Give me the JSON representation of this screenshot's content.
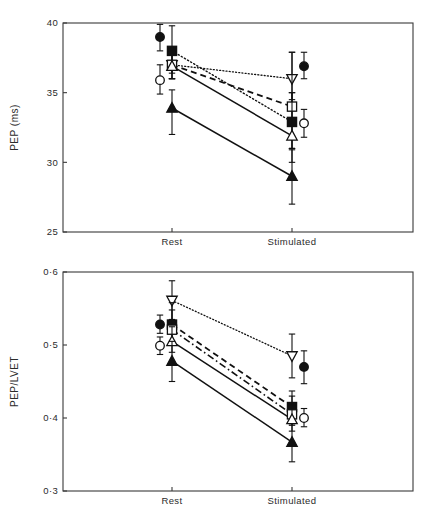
{
  "figure": {
    "panels": [
      "pep",
      "ratio"
    ]
  },
  "chart_data": [
    {
      "id": "pep",
      "type": "line",
      "title": "",
      "xlabel": "",
      "ylabel": "PEP (ms)",
      "categories": [
        "Rest",
        "Stimulated"
      ],
      "x_tick_labels": [
        "Rest",
        "Stimulated"
      ],
      "y_tick_labels": [
        "40",
        "35",
        "30",
        "25"
      ],
      "y_ticks": [
        40,
        35,
        30,
        25
      ],
      "ylim": [
        25,
        40
      ],
      "grid": false,
      "legend": "none",
      "series": [
        {
          "name": "filled-circle",
          "marker": "filled-circle",
          "line": "none",
          "offset": "left",
          "values": [
            39.0,
            36.9
          ],
          "err_low": [
            38.0,
            36.0
          ],
          "err_high": [
            39.9,
            37.9
          ]
        },
        {
          "name": "open-circle",
          "marker": "open-circle",
          "line": "none",
          "offset": "left-right",
          "values": [
            35.9,
            32.8
          ],
          "err_low": [
            34.9,
            31.8
          ],
          "err_high": [
            37.0,
            33.8
          ]
        },
        {
          "name": "filled-square",
          "marker": "filled-square",
          "line": "dotted",
          "offset": "center",
          "values": [
            38.0,
            32.9
          ],
          "err_low": [
            36.4,
            31.0
          ],
          "err_high": [
            39.8,
            35.0
          ]
        },
        {
          "name": "open-down-triangle",
          "marker": "open-down-triangle",
          "line": "fine-dotted",
          "offset": "center",
          "values": [
            37.0,
            36.0
          ],
          "err_low": [
            36.0,
            34.5
          ],
          "err_high": [
            38.0,
            37.9
          ]
        },
        {
          "name": "open-square",
          "marker": "open-square",
          "line": "dashed",
          "offset": "center",
          "values": [
            37.0,
            34.0
          ],
          "err_low": [
            36.0,
            31.0
          ],
          "err_high": [
            38.0,
            37.9
          ]
        },
        {
          "name": "open-triangle",
          "marker": "open-triangle",
          "line": "solid",
          "offset": "center",
          "values": [
            36.9,
            31.9
          ],
          "err_low": [
            36.0,
            30.0
          ],
          "err_high": [
            38.0,
            35.0
          ]
        },
        {
          "name": "filled-triangle",
          "marker": "filled-triangle",
          "line": "solid",
          "offset": "center",
          "values": [
            33.9,
            29.0
          ],
          "err_low": [
            32.0,
            27.0
          ],
          "err_high": [
            35.2,
            30.9
          ]
        }
      ]
    },
    {
      "id": "ratio",
      "type": "line",
      "title": "",
      "xlabel": "",
      "ylabel": "PEP/LVET",
      "categories": [
        "Rest",
        "Stimulated"
      ],
      "x_tick_labels": [
        "Rest",
        "Stimulated"
      ],
      "y_tick_labels": [
        "0·6",
        "0·5",
        "0·4",
        "0·3"
      ],
      "y_ticks": [
        0.6,
        0.5,
        0.4,
        0.3
      ],
      "ylim": [
        0.3,
        0.6
      ],
      "grid": false,
      "legend": "none",
      "series": [
        {
          "name": "filled-circle",
          "marker": "filled-circle",
          "line": "none",
          "offset": "left",
          "values": [
            0.528,
            0.47
          ],
          "err_low": [
            0.516,
            0.447
          ],
          "err_high": [
            0.541,
            0.492
          ]
        },
        {
          "name": "open-circle",
          "marker": "open-circle",
          "line": "none",
          "offset": "left-right",
          "values": [
            0.499,
            0.4
          ],
          "err_low": [
            0.487,
            0.388
          ],
          "err_high": [
            0.511,
            0.413
          ]
        },
        {
          "name": "open-down-triangle",
          "marker": "open-down-triangle",
          "line": "fine-dotted",
          "offset": "center",
          "values": [
            0.561,
            0.485
          ],
          "err_low": [
            0.535,
            0.455
          ],
          "err_high": [
            0.588,
            0.515
          ]
        },
        {
          "name": "filled-square",
          "marker": "filled-square",
          "line": "dashed",
          "offset": "center",
          "values": [
            0.528,
            0.415
          ],
          "err_low": [
            0.5,
            0.396
          ],
          "err_high": [
            0.558,
            0.437
          ]
        },
        {
          "name": "open-square",
          "marker": "open-square",
          "line": "dash-dot",
          "offset": "center",
          "values": [
            0.521,
            0.405
          ],
          "err_low": [
            0.5,
            0.39
          ],
          "err_high": [
            0.548,
            0.43
          ]
        },
        {
          "name": "open-triangle",
          "marker": "open-triangle",
          "line": "solid",
          "offset": "center",
          "values": [
            0.505,
            0.398
          ],
          "err_low": [
            0.49,
            0.382
          ],
          "err_high": [
            0.525,
            0.418
          ]
        },
        {
          "name": "filled-triangle",
          "marker": "filled-triangle",
          "line": "solid",
          "offset": "center",
          "values": [
            0.478,
            0.367
          ],
          "err_low": [
            0.45,
            0.34
          ],
          "err_high": [
            0.505,
            0.392
          ]
        }
      ]
    }
  ]
}
